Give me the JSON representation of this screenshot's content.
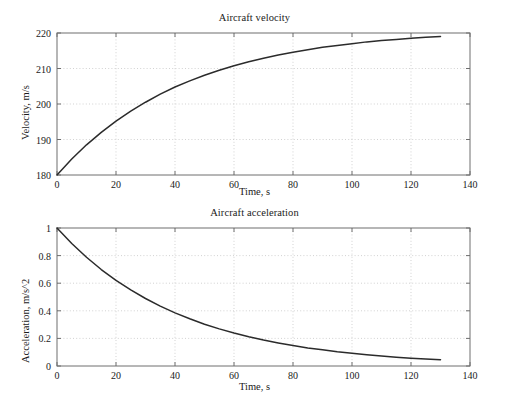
{
  "figure": {
    "background_color": "#ffffff",
    "axis_color": "#6e6e6e",
    "grid_color": "#bfbfbf",
    "curve_color": "#2b2b2b",
    "text_color": "#1a1a1a"
  },
  "charts": [
    {
      "id": "velocity",
      "title": "Aircraft velocity",
      "xlabel": "Time, s",
      "ylabel": "Velocity, m/s"
    },
    {
      "id": "acceleration",
      "title": "Aircraft acceleration",
      "xlabel": "Time, s",
      "ylabel": "Acceleration, m/s^2"
    }
  ],
  "chart_data": [
    {
      "type": "line",
      "title": "Aircraft velocity",
      "xlabel": "Time, s",
      "ylabel": "Velocity, m/s",
      "xlim": [
        0,
        140
      ],
      "ylim": [
        180,
        220
      ],
      "xticks": [
        0,
        20,
        40,
        60,
        80,
        100,
        120,
        140
      ],
      "xticklabels": [
        "0",
        "20",
        "40",
        "60",
        "80",
        "100",
        "120",
        "140"
      ],
      "yticks": [
        180,
        190,
        200,
        210,
        220
      ],
      "yticklabels": [
        "180",
        "190",
        "200",
        "210",
        "220"
      ],
      "grid": true,
      "grid_style": "dotted",
      "legend": null,
      "series": [
        {
          "name": "velocity",
          "x": [
            0,
            5,
            10,
            15,
            20,
            25,
            30,
            35,
            40,
            45,
            50,
            55,
            60,
            65,
            70,
            75,
            80,
            85,
            90,
            95,
            100,
            105,
            110,
            115,
            120,
            125,
            130
          ],
          "y": [
            180.0,
            184.5,
            188.5,
            192.0,
            195.2,
            198.0,
            200.5,
            202.8,
            204.8,
            206.5,
            208.1,
            209.5,
            210.8,
            211.9,
            212.9,
            213.8,
            214.6,
            215.3,
            216.0,
            216.5,
            217.0,
            217.5,
            217.9,
            218.2,
            218.5,
            218.8,
            219.0
          ]
        }
      ]
    },
    {
      "type": "line",
      "title": "Aircraft acceleration",
      "xlabel": "Time, s",
      "ylabel": "Acceleration, m/s^2",
      "xlim": [
        0,
        140
      ],
      "ylim": [
        0,
        1
      ],
      "xticks": [
        0,
        20,
        40,
        60,
        80,
        100,
        120,
        140
      ],
      "xticklabels": [
        "0",
        "20",
        "40",
        "60",
        "80",
        "100",
        "120",
        "140"
      ],
      "yticks": [
        0,
        0.2,
        0.4,
        0.6,
        0.8,
        1
      ],
      "yticklabels": [
        "0",
        "0.2",
        "0.4",
        "0.6",
        "0.8",
        "1"
      ],
      "grid": true,
      "grid_style": "dotted",
      "legend": null,
      "series": [
        {
          "name": "acceleration",
          "x": [
            0,
            5,
            10,
            15,
            20,
            25,
            30,
            35,
            40,
            45,
            50,
            55,
            60,
            65,
            70,
            75,
            80,
            85,
            90,
            95,
            100,
            105,
            110,
            115,
            120,
            125,
            130
          ],
          "y": [
            1.0,
            0.888,
            0.788,
            0.699,
            0.621,
            0.551,
            0.489,
            0.434,
            0.385,
            0.342,
            0.303,
            0.269,
            0.239,
            0.212,
            0.188,
            0.167,
            0.148,
            0.131,
            0.117,
            0.103,
            0.092,
            0.081,
            0.072,
            0.064,
            0.057,
            0.051,
            0.045
          ]
        }
      ]
    }
  ]
}
